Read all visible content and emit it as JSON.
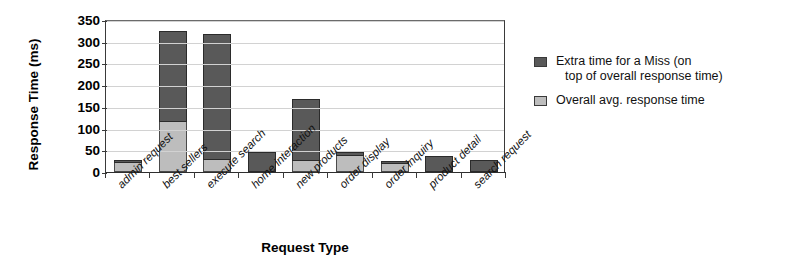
{
  "chart_data": {
    "type": "bar",
    "stacked": true,
    "title": "",
    "xlabel": "Request Type",
    "ylabel": "Response Time (ms)",
    "ylim": [
      0,
      350
    ],
    "ytick_step": 50,
    "yticks": [
      "350",
      "300",
      "250",
      "200",
      "150",
      "100",
      "50",
      "0"
    ],
    "grid": true,
    "legend_position": "right",
    "categories": [
      "admin request",
      "best sellers",
      "execute search",
      "home interaction",
      "new products",
      "order display",
      "order inquiry",
      "product detail",
      "search request"
    ],
    "series": [
      {
        "name": "Overall avg. response time",
        "color": "#bdbdbd",
        "values": [
          20,
          115,
          27,
          0,
          25,
          38,
          18,
          0,
          0
        ]
      },
      {
        "name": "Extra time for a Miss (on top of overall response time)",
        "color": "#595959",
        "values": [
          8,
          210,
          291,
          47,
          143,
          9,
          7,
          38,
          27
        ]
      }
    ],
    "totals": [
      28,
      325,
      318,
      47,
      168,
      47,
      25,
      38,
      27
    ]
  },
  "legend": {
    "entries": [
      {
        "swatch": "dark",
        "line1": "Extra time for a Miss (on",
        "line2": "top of overall response time)"
      },
      {
        "swatch": "light",
        "line1": "Overall avg. response time",
        "line2": ""
      }
    ]
  }
}
